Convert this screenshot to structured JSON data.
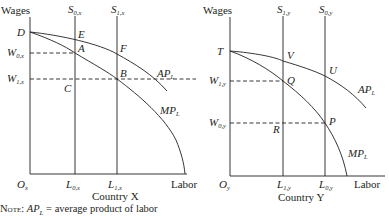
{
  "figure": {
    "panels": [
      {
        "id": "country-x",
        "title": "Country X",
        "y_axis_label": "Wages",
        "x_axis_label": "Labor",
        "origin_label": "O",
        "origin_sub": "x",
        "supply_lines": [
          {
            "label": "S",
            "sub": "0,x"
          },
          {
            "label": "S",
            "sub": "1,x"
          }
        ],
        "wage_levels": [
          {
            "label": "W",
            "sub": "0,x"
          },
          {
            "label": "W",
            "sub": "1,x"
          }
        ],
        "labor_levels": [
          {
            "label": "L",
            "sub": "0,x"
          },
          {
            "label": "L",
            "sub": "1,x"
          }
        ],
        "points": [
          "D",
          "E",
          "A",
          "F",
          "B",
          "C"
        ],
        "curves": [
          {
            "label": "AP",
            "sub": "L"
          },
          {
            "label": "MP",
            "sub": "L"
          }
        ]
      },
      {
        "id": "country-y",
        "title": "Country Y",
        "y_axis_label": "Wages",
        "x_axis_label": "Labor",
        "origin_label": "O",
        "origin_sub": "y",
        "supply_lines": [
          {
            "label": "S",
            "sub": "1,y"
          },
          {
            "label": "S",
            "sub": "0,y"
          }
        ],
        "wage_levels": [
          {
            "label": "W",
            "sub": "1,y"
          },
          {
            "label": "W",
            "sub": "0,y"
          }
        ],
        "labor_levels": [
          {
            "label": "L",
            "sub": "1,y"
          },
          {
            "label": "L",
            "sub": "0,y"
          }
        ],
        "points": [
          "T",
          "V",
          "U",
          "Q",
          "P",
          "R"
        ],
        "curves": [
          {
            "label": "AP",
            "sub": "L"
          },
          {
            "label": "MP",
            "sub": "L"
          }
        ]
      }
    ],
    "note": {
      "prefix": "Note:",
      "term": "AP",
      "term_sub": "L",
      "definition": " = average product of labor"
    }
  }
}
